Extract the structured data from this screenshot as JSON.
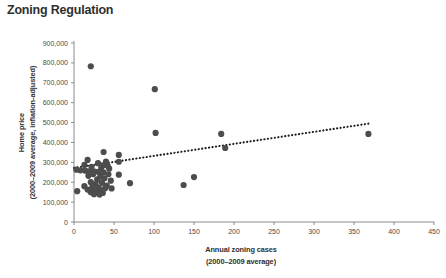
{
  "title": "Zoning Regulation",
  "chart_data": {
    "type": "scatter",
    "title": "Zoning Regulation",
    "xlabel": "Annual zoning cases",
    "xlabel_sub": "(2000–2009 average)",
    "ylabel": "Home price",
    "ylabel_sub": "(2000–2009 average, inflation-adjusted)",
    "xlim": [
      0,
      450
    ],
    "ylim": [
      0,
      900000
    ],
    "xticks": [
      0,
      50,
      100,
      150,
      200,
      250,
      300,
      350,
      400,
      450
    ],
    "xtick_labels": [
      "0",
      "50",
      "100",
      "150",
      "200",
      "250",
      "300",
      "350",
      "400",
      "450"
    ],
    "yticks": [
      0,
      100000,
      200000,
      300000,
      400000,
      500000,
      600000,
      700000,
      800000,
      900000
    ],
    "ytick_labels": [
      "0",
      "100,000",
      "200,000",
      "300,000",
      "400,000",
      "500,000",
      "600,000",
      "700,000",
      "800,000",
      "900,000"
    ],
    "grid": false,
    "legend": null,
    "marker_color": "#4d4d4d",
    "marker_size": 3.1,
    "trendline": {
      "style": "dotted",
      "color": "#1f1f1f",
      "x_start": 0,
      "y_start": 272000,
      "x_end": 372,
      "y_end": 497000
    },
    "points": [
      {
        "x": 21,
        "y": 783000
      },
      {
        "x": 101,
        "y": 668000
      },
      {
        "x": 102,
        "y": 448000
      },
      {
        "x": 184,
        "y": 443000
      },
      {
        "x": 368,
        "y": 443000
      },
      {
        "x": 189,
        "y": 372000
      },
      {
        "x": 37,
        "y": 352000
      },
      {
        "x": 56,
        "y": 337000
      },
      {
        "x": 17,
        "y": 312000
      },
      {
        "x": 40,
        "y": 304000
      },
      {
        "x": 56,
        "y": 303000
      },
      {
        "x": 30,
        "y": 296000
      },
      {
        "x": 13,
        "y": 287000
      },
      {
        "x": 37,
        "y": 286000
      },
      {
        "x": 42,
        "y": 283000
      },
      {
        "x": 22,
        "y": 277000
      },
      {
        "x": 34,
        "y": 272000
      },
      {
        "x": 44,
        "y": 268000
      },
      {
        "x": 3,
        "y": 263000
      },
      {
        "x": 8,
        "y": 260000
      },
      {
        "x": 14,
        "y": 258000
      },
      {
        "x": 19,
        "y": 255000
      },
      {
        "x": 26,
        "y": 254000
      },
      {
        "x": 31,
        "y": 252000
      },
      {
        "x": 37,
        "y": 250000
      },
      {
        "x": 24,
        "y": 241000
      },
      {
        "x": 43,
        "y": 240000
      },
      {
        "x": 56,
        "y": 238000
      },
      {
        "x": 18,
        "y": 232000
      },
      {
        "x": 33,
        "y": 228000
      },
      {
        "x": 150,
        "y": 226000
      },
      {
        "x": 38,
        "y": 220000
      },
      {
        "x": 29,
        "y": 214000
      },
      {
        "x": 46,
        "y": 208000
      },
      {
        "x": 21,
        "y": 200000
      },
      {
        "x": 35,
        "y": 197000
      },
      {
        "x": 70,
        "y": 195000
      },
      {
        "x": 27,
        "y": 190000
      },
      {
        "x": 137,
        "y": 186000
      },
      {
        "x": 41,
        "y": 183000
      },
      {
        "x": 13,
        "y": 180000
      },
      {
        "x": 23,
        "y": 176000
      },
      {
        "x": 31,
        "y": 172000
      },
      {
        "x": 39,
        "y": 170000
      },
      {
        "x": 47,
        "y": 169000
      },
      {
        "x": 17,
        "y": 163000
      },
      {
        "x": 26,
        "y": 160000
      },
      {
        "x": 34,
        "y": 158000
      },
      {
        "x": 4,
        "y": 155000
      },
      {
        "x": 21,
        "y": 150000
      },
      {
        "x": 29,
        "y": 148000
      },
      {
        "x": 36,
        "y": 146000
      },
      {
        "x": 25,
        "y": 140000
      },
      {
        "x": 32,
        "y": 138000
      }
    ]
  }
}
